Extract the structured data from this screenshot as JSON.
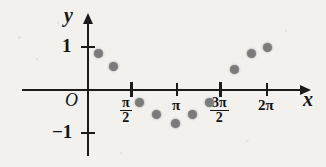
{
  "figure": {
    "background_color": "#f2f1ee",
    "ink_color": "#1b1b1b",
    "point_color": "#7b7b7b",
    "axis_labels": {
      "y": "y",
      "x": "x",
      "origin": "O"
    },
    "y_tick_labels": {
      "positive_one": "1",
      "negative_one": "−1"
    },
    "x_tick_labels": [
      {
        "name": "pi-over-2",
        "numerator": "π",
        "denominator": "2",
        "display": "π/2"
      },
      {
        "name": "pi",
        "text": "π"
      },
      {
        "name": "three-pi-over-2",
        "numerator": "3π",
        "denominator": "2",
        "display": "3π/2"
      },
      {
        "name": "two-pi",
        "text": "2π"
      }
    ]
  },
  "chart_data": {
    "type": "scatter",
    "title": "",
    "xlabel": "x",
    "ylabel": "y",
    "xlim": [
      0,
      6.9
    ],
    "ylim": [
      -1.35,
      1.35
    ],
    "grid": false,
    "legend": "none",
    "x_ticks": [
      1.5708,
      3.1416,
      4.7124,
      6.2832
    ],
    "x_tick_text": [
      "π/2",
      "π",
      "3π/2",
      "2π"
    ],
    "y_ticks": [
      -1,
      1
    ],
    "y_tick_text": [
      "−1",
      "1"
    ],
    "series": [
      {
        "name": "sampled points",
        "marker": "filled-circle",
        "color": "#7b7b7b",
        "points": [
          {
            "x": 0.35,
            "y": 0.86
          },
          {
            "x": 0.9,
            "y": 0.56
          },
          {
            "x": 1.8,
            "y": -0.28
          },
          {
            "x": 2.4,
            "y": -0.56
          },
          {
            "x": 3.05,
            "y": -0.77
          },
          {
            "x": 3.65,
            "y": -0.56
          },
          {
            "x": 4.25,
            "y": -0.28
          },
          {
            "x": 5.15,
            "y": 0.49
          },
          {
            "x": 5.75,
            "y": 0.84
          },
          {
            "x": 6.3,
            "y": 1.0
          }
        ]
      }
    ]
  }
}
